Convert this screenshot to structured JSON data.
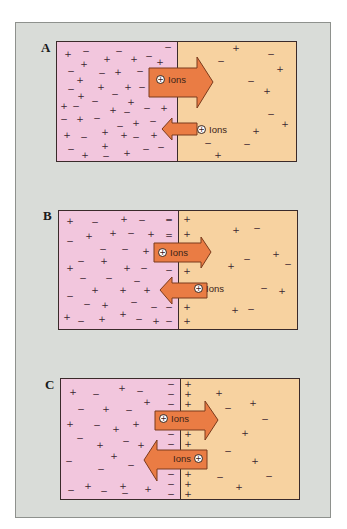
{
  "figure": {
    "colors": {
      "frame_bg": "#d9dcd8",
      "left_region": "#f2c6dd",
      "right_region": "#f7d2a0",
      "arrow_fill": "#ea7c44",
      "arrow_stroke": "#7a3a1c",
      "border": "#3a2a2a"
    },
    "ion_symbol": "+",
    "panels": [
      {
        "label": "A",
        "arrows": [
          {
            "direction": "right",
            "size": "large",
            "text": "Ions",
            "icon": "positive-ion-icon"
          },
          {
            "direction": "left",
            "size": "small",
            "text": "Ions",
            "icon": "positive-ion-icon"
          }
        ],
        "signs": [
          [
            "+",
            11,
            12
          ],
          [
            "−",
            29,
            9
          ],
          [
            "−",
            62,
            9
          ],
          [
            "−",
            111,
            5
          ],
          [
            "+",
            27,
            22
          ],
          [
            "+",
            50,
            17
          ],
          [
            "+",
            77,
            17
          ],
          [
            "−",
            92,
            14
          ],
          [
            "+",
            103,
            20
          ],
          [
            "−",
            14,
            29
          ],
          [
            "−",
            45,
            31
          ],
          [
            "+",
            61,
            30
          ],
          [
            "−",
            83,
            29
          ],
          [
            "+",
            23,
            38
          ],
          [
            "+",
            44,
            45
          ],
          [
            "+",
            71,
            45
          ],
          [
            "−",
            14,
            47
          ],
          [
            "−",
            85,
            45
          ],
          [
            "+",
            24,
            54
          ],
          [
            "−",
            38,
            59
          ],
          [
            "−",
            58,
            52
          ],
          [
            "+",
            7,
            64
          ],
          [
            "−",
            19,
            64
          ],
          [
            "+",
            74,
            60
          ],
          [
            "+",
            56,
            68
          ],
          [
            "−",
            70,
            70
          ],
          [
            "+",
            107,
            66
          ],
          [
            "−",
            90,
            66
          ],
          [
            "−",
            7,
            77
          ],
          [
            "+",
            23,
            77
          ],
          [
            "−",
            40,
            76
          ],
          [
            "−",
            63,
            84
          ],
          [
            "+",
            79,
            81
          ],
          [
            "−",
            96,
            79
          ],
          [
            "+",
            10,
            93
          ],
          [
            "−",
            27,
            95
          ],
          [
            "+",
            48,
            90
          ],
          [
            "+",
            67,
            93
          ],
          [
            "+",
            97,
            93
          ],
          [
            "−",
            79,
            95
          ],
          [
            "−",
            14,
            107
          ],
          [
            "+",
            48,
            104
          ],
          [
            "+",
            28,
            113
          ],
          [
            "−",
            49,
            114
          ],
          [
            "+",
            70,
            111
          ],
          [
            "−",
            89,
            107
          ],
          [
            "−",
            104,
            105
          ],
          [
            "+",
            179,
            6
          ],
          [
            "−",
            214,
            12
          ],
          [
            "−",
            164,
            19
          ],
          [
            "+",
            223,
            27
          ],
          [
            "−",
            194,
            39
          ],
          [
            "+",
            210,
            49
          ],
          [
            "−",
            214,
            72
          ],
          [
            "+",
            228,
            82
          ],
          [
            "+",
            199,
            89
          ],
          [
            "−",
            151,
            101
          ],
          [
            "−",
            190,
            102
          ],
          [
            "+",
            161,
            113
          ]
        ]
      },
      {
        "label": "B",
        "arrows": [
          {
            "direction": "right",
            "size": "large",
            "text": "Ions",
            "icon": "positive-ion-icon"
          },
          {
            "direction": "left",
            "size": "large",
            "text": "Ions",
            "icon": "positive-ion-icon"
          }
        ],
        "signs": [
          [
            "+",
            11,
            10
          ],
          [
            "−",
            36,
            11
          ],
          [
            "+",
            65,
            8
          ],
          [
            "−",
            83,
            9
          ],
          [
            "−",
            110,
            9
          ],
          [
            "+",
            30,
            25
          ],
          [
            "+",
            54,
            22
          ],
          [
            "−",
            72,
            22
          ],
          [
            "+",
            92,
            23
          ],
          [
            "−",
            110,
            25
          ],
          [
            "−",
            11,
            30
          ],
          [
            "−",
            44,
            38
          ],
          [
            "−",
            66,
            38
          ],
          [
            "+",
            87,
            40
          ],
          [
            "−",
            22,
            50
          ],
          [
            "+",
            45,
            50
          ],
          [
            "+",
            11,
            57
          ],
          [
            "+",
            68,
            57
          ],
          [
            "−",
            85,
            57
          ],
          [
            "−",
            24,
            67
          ],
          [
            "−",
            50,
            67
          ],
          [
            "−",
            78,
            70
          ],
          [
            "+",
            36,
            79
          ],
          [
            "+",
            64,
            79
          ],
          [
            "+",
            88,
            79
          ],
          [
            "−",
            11,
            85
          ],
          [
            "−",
            28,
            93
          ],
          [
            "+",
            46,
            94
          ],
          [
            "−",
            75,
            91
          ],
          [
            "−",
            95,
            96
          ],
          [
            "+",
            8,
            106
          ],
          [
            "−",
            22,
            110
          ],
          [
            "+",
            43,
            108
          ],
          [
            "+",
            64,
            103
          ],
          [
            "−",
            80,
            108
          ],
          [
            "+",
            97,
            110
          ],
          [
            "−",
            110,
            8
          ],
          [
            "−",
            110,
            23
          ],
          [
            "−",
            110,
            59
          ],
          [
            "−",
            110,
            96
          ],
          [
            "−",
            110,
            110
          ],
          [
            "+",
            128,
            8
          ],
          [
            "+",
            128,
            23
          ],
          [
            "+",
            128,
            60
          ],
          [
            "+",
            128,
            96
          ],
          [
            "+",
            128,
            110
          ],
          [
            "+",
            177,
            19
          ],
          [
            "−",
            198,
            17
          ],
          [
            "−",
            188,
            48
          ],
          [
            "+",
            217,
            43
          ],
          [
            "+",
            172,
            55
          ],
          [
            "−",
            229,
            53
          ],
          [
            "−",
            205,
            77
          ],
          [
            "+",
            223,
            80
          ],
          [
            "+",
            176,
            99
          ],
          [
            "−",
            192,
            98
          ]
        ]
      },
      {
        "label": "C",
        "arrows": [
          {
            "direction": "right",
            "size": "large",
            "text": "Ions",
            "icon": "positive-ion-icon"
          },
          {
            "direction": "left",
            "size": "xlarge",
            "text": "Ions",
            "icon": "positive-ion-icon"
          }
        ],
        "signs": [
          [
            "+",
            12,
            13
          ],
          [
            "−",
            35,
            15
          ],
          [
            "+",
            61,
            9
          ],
          [
            "−",
            79,
            12
          ],
          [
            "+",
            86,
            23
          ],
          [
            "−",
            20,
            30
          ],
          [
            "+",
            45,
            30
          ],
          [
            "−",
            68,
            31
          ],
          [
            "+",
            9,
            45
          ],
          [
            "−",
            36,
            46
          ],
          [
            "+",
            55,
            50
          ],
          [
            "+",
            75,
            45
          ],
          [
            "−",
            19,
            59
          ],
          [
            "+",
            39,
            66
          ],
          [
            "−",
            65,
            62
          ],
          [
            "+",
            80,
            66
          ],
          [
            "−",
            8,
            82
          ],
          [
            "+",
            53,
            77
          ],
          [
            "−",
            40,
            90
          ],
          [
            "−",
            70,
            86
          ],
          [
            "+",
            27,
            107
          ],
          [
            "−",
            10,
            111
          ],
          [
            "−",
            43,
            112
          ],
          [
            "+",
            62,
            107
          ],
          [
            "−",
            64,
            114
          ],
          [
            "+",
            87,
            110
          ],
          [
            "−",
            110,
            5
          ],
          [
            "−",
            110,
            15
          ],
          [
            "−",
            110,
            25
          ],
          [
            "−",
            110,
            55
          ],
          [
            "−",
            110,
            65
          ],
          [
            "−",
            110,
            95
          ],
          [
            "−",
            110,
            105
          ],
          [
            "−",
            110,
            115
          ],
          [
            "+",
            127,
            5
          ],
          [
            "+",
            127,
            15
          ],
          [
            "+",
            127,
            25
          ],
          [
            "+",
            127,
            55
          ],
          [
            "+",
            127,
            65
          ],
          [
            "+",
            127,
            95
          ],
          [
            "+",
            127,
            105
          ],
          [
            "+",
            127,
            115
          ],
          [
            "+",
            158,
            14
          ],
          [
            "−",
            167,
            29
          ],
          [
            "+",
            192,
            24
          ],
          [
            "−",
            204,
            40
          ],
          [
            "+",
            184,
            54
          ],
          [
            "−",
            167,
            72
          ],
          [
            "+",
            194,
            82
          ],
          [
            "−",
            159,
            98
          ],
          [
            "+",
            178,
            108
          ],
          [
            "−",
            208,
            97
          ]
        ]
      }
    ]
  }
}
